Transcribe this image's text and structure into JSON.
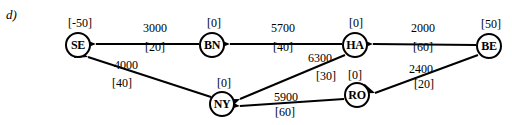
{
  "figure": {
    "part_label": "d)",
    "type": "directed-network-flow-graph",
    "colors": {
      "stroke": "#000000",
      "background": "#ffffff",
      "text": "#000000"
    }
  },
  "nodes": [
    {
      "id": "SE",
      "label": "SE",
      "supply": "[-50]",
      "x": 78,
      "y": 45,
      "supply_x": 80,
      "supply_y": 23
    },
    {
      "id": "BN",
      "label": "BN",
      "supply": "[0]",
      "x": 212,
      "y": 45,
      "supply_x": 214,
      "supply_y": 23
    },
    {
      "id": "HA",
      "label": "HA",
      "supply": "[0]",
      "x": 355,
      "y": 45,
      "supply_x": 356,
      "supply_y": 23
    },
    {
      "id": "BE",
      "label": "BE",
      "supply": "[50]",
      "x": 489,
      "y": 46,
      "supply_x": 491,
      "supply_y": 24
    },
    {
      "id": "NY",
      "label": "NY",
      "supply": "[0]",
      "x": 222,
      "y": 104,
      "supply_x": 224,
      "supply_y": 83
    },
    {
      "id": "RO",
      "label": "RO",
      "supply": "[0]",
      "x": 357,
      "y": 95,
      "supply_x": 355,
      "supply_y": 75
    }
  ],
  "edges": [
    {
      "from": "BN",
      "to": "SE",
      "cost": "3000",
      "capacity": "[20]",
      "cost_x": 155,
      "cost_y": 28,
      "cap_x": 155,
      "cap_y": 47
    },
    {
      "from": "HA",
      "to": "BN",
      "cost": "5700",
      "capacity": "[40]",
      "cost_x": 283,
      "cost_y": 28,
      "cap_x": 283,
      "cap_y": 47
    },
    {
      "from": "BE",
      "to": "HA",
      "cost": "2000",
      "capacity": "[60]",
      "cost_x": 423,
      "cost_y": 28,
      "cap_x": 423,
      "cap_y": 47
    },
    {
      "from": "NY",
      "to": "SE",
      "cost": "4000",
      "capacity": "[40]",
      "cost_x": 126,
      "cost_y": 65,
      "cap_x": 122,
      "cap_y": 83
    },
    {
      "from": "HA",
      "to": "NY",
      "cost": "6300",
      "capacity": "[30]",
      "cost_x": 320,
      "cost_y": 58,
      "cap_x": 326,
      "cap_y": 76
    },
    {
      "from": "RO",
      "to": "NY",
      "cost": "5900",
      "capacity": "[60]",
      "cost_x": 286,
      "cost_y": 97,
      "cap_x": 285,
      "cap_y": 112
    },
    {
      "from": "BE",
      "to": "RO",
      "cost": "2400",
      "capacity": "[20]",
      "cost_x": 421,
      "cost_y": 69,
      "cap_x": 424,
      "cap_y": 84
    }
  ],
  "geometry": {
    "lines": [
      {
        "name": "edge-line-bn-se",
        "x1": 199,
        "y1": 44,
        "x2": 96,
        "y2": 44
      },
      {
        "name": "edge-line-ha-bn",
        "x1": 342,
        "y1": 44,
        "x2": 230,
        "y2": 44
      },
      {
        "name": "edge-line-be-ha",
        "x1": 476,
        "y1": 45,
        "x2": 373,
        "y2": 44
      },
      {
        "name": "edge-line-ny-se",
        "x1": 211,
        "y1": 97,
        "x2": 88,
        "y2": 57
      },
      {
        "name": "edge-line-ha-ny",
        "x1": 345,
        "y1": 55,
        "x2": 240,
        "y2": 99
      },
      {
        "name": "edge-line-ro-ny",
        "x1": 344,
        "y1": 99,
        "x2": 240,
        "y2": 106
      },
      {
        "name": "edge-line-be-ro",
        "x1": 478,
        "y1": 55,
        "x2": 375,
        "y2": 93
      }
    ],
    "arrowheads": [
      {
        "name": "arrowhead-bn-se",
        "x": 96,
        "y": 44,
        "angle": 180
      },
      {
        "name": "arrowhead-ha-bn",
        "x": 230,
        "y": 44,
        "angle": 180
      },
      {
        "name": "arrowhead-be-ha",
        "x": 373,
        "y": 44,
        "angle": 180
      },
      {
        "name": "arrowhead-ny-se",
        "x": 88,
        "y": 57,
        "angle": 198
      },
      {
        "name": "arrowhead-ha-ny",
        "x": 240,
        "y": 99,
        "angle": 157
      },
      {
        "name": "arrowhead-ro-ny",
        "x": 240,
        "y": 106,
        "angle": 184
      },
      {
        "name": "arrowhead-be-ro",
        "x": 375,
        "y": 93,
        "angle": 200
      }
    ]
  },
  "chart_data": {
    "type": "diagram",
    "title": "d)",
    "node_ids": [
      "SE",
      "BN",
      "HA",
      "BE",
      "NY",
      "RO"
    ],
    "node_supplies": [
      -50,
      0,
      0,
      50,
      0,
      0
    ],
    "arcs": [
      {
        "from": "BN",
        "to": "SE",
        "cost": 3000,
        "capacity": 20
      },
      {
        "from": "HA",
        "to": "BN",
        "cost": 5700,
        "capacity": 40
      },
      {
        "from": "BE",
        "to": "HA",
        "cost": 2000,
        "capacity": 60
      },
      {
        "from": "NY",
        "to": "SE",
        "cost": 4000,
        "capacity": 40
      },
      {
        "from": "HA",
        "to": "NY",
        "cost": 6300,
        "capacity": 30
      },
      {
        "from": "RO",
        "to": "NY",
        "cost": 5900,
        "capacity": 60
      },
      {
        "from": "BE",
        "to": "RO",
        "cost": 2400,
        "capacity": 20
      }
    ]
  }
}
